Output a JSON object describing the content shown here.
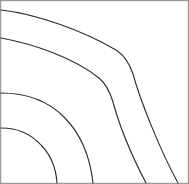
{
  "figure": {
    "title": "",
    "width": 189,
    "height": 184,
    "background_color": "#ffffff",
    "border_color": "#9a9a9a",
    "border_width": 1.2
  },
  "chart_data": {
    "type": "line",
    "title": "",
    "subtitle": "",
    "xlabel": "",
    "ylabel": "",
    "xlim": [
      0,
      189
    ],
    "ylim": [
      0,
      184
    ],
    "grid": false,
    "legend": false,
    "legend_position": "none",
    "axes_visible": false,
    "tick_labels": [],
    "annotations": [],
    "series": [
      {
        "name": "contour-4-outer",
        "color": "#2b2b2b",
        "width": 1.1,
        "left_edge_y": 10,
        "bottom_edge_x": 178,
        "bend_point": [
          125,
          60
        ],
        "path": "M 1,10 C 36,14 82,30 116,50 C 124,55 129,62 133,74 C 140,100 160,150 178,183"
      },
      {
        "name": "contour-3",
        "color": "#2b2b2b",
        "width": 1.1,
        "left_edge_y": 38,
        "bottom_edge_x": 146,
        "bend_point": [
          104,
          82
        ],
        "path": "M 1,38 C 34,44 74,58 99,78 C 106,84 110,92 113,102 C 120,128 134,160 146,183"
      },
      {
        "name": "contour-2",
        "color": "#2b2b2b",
        "width": 1.1,
        "left_edge_y": 93,
        "bottom_edge_x": 93,
        "path": "M 1,93 C 26,93 48,101 64,117 C 80,133 90,156 93,183"
      },
      {
        "name": "contour-1-inner",
        "color": "#2b2b2b",
        "width": 1.1,
        "left_edge_y": 128,
        "bottom_edge_x": 57,
        "path": "M 1,128 C 17,128 31,134 41,145 C 51,155 56,168 57,183"
      }
    ]
  }
}
